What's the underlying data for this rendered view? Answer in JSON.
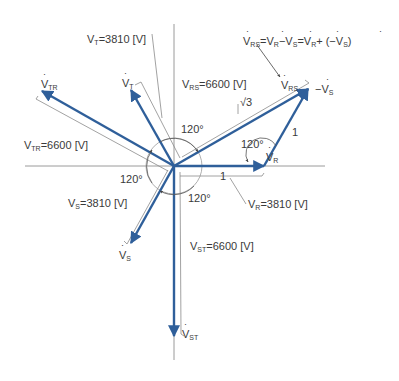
{
  "diagram": {
    "type": "three-phase voltage phasor diagram",
    "colors": {
      "phasor": "#2f5f9a",
      "axis": "#9a9a9a",
      "bracket": "#8a8a8a",
      "text": "#3a3a3a"
    },
    "equation": {
      "lhs": "V",
      "lhs_sub": "RS",
      "eq1": "=",
      "t1": "V",
      "t1_sub": "R",
      "minus": "−",
      "t2": "V",
      "t2_sub": "S",
      "eq2": "=",
      "t3": "V",
      "t3_sub": "R",
      "plus": "+ (−",
      "t4": "V",
      "t4_sub": "S",
      "close": ")"
    },
    "labels": {
      "vt_mag": {
        "v": "V",
        "sub": "T",
        "val": "=3810 [V]"
      },
      "vrs_mag": {
        "v": "V",
        "sub": "RS",
        "val": "=6600 [V]"
      },
      "vtr_mag": {
        "v": "V",
        "sub": "TR",
        "val": "=6600 [V]"
      },
      "vs_mag": {
        "v": "V",
        "sub": "S",
        "val": "=3810 [V]"
      },
      "vr_mag": {
        "v": "V",
        "sub": "R",
        "val": "=3810 [V]"
      },
      "vst_mag": {
        "v": "V",
        "sub": "ST",
        "val": "=6600 [V]"
      }
    },
    "phasor_names": {
      "vtr": {
        "v": "V",
        "sub": "TR"
      },
      "vt": {
        "v": "V",
        "sub": "T"
      },
      "vrs": {
        "v": "V",
        "sub": "RS"
      },
      "neg_vs": {
        "prefix": "−",
        "v": "V",
        "sub": "S"
      },
      "vr": {
        "v": "V",
        "sub": "R"
      },
      "vs": {
        "v": "V",
        "sub": "S"
      },
      "vst": {
        "v": "V",
        "sub": "ST"
      }
    },
    "angles": {
      "a_top": "120°",
      "a_left": "120°",
      "a_bottom": "120°",
      "a_right": "120°"
    },
    "ratios": {
      "sqrt3": "√3",
      "one_side": "1",
      "one_base": "1"
    }
  }
}
